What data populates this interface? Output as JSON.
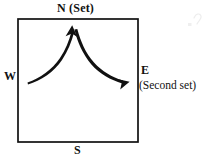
{
  "figure": {
    "type": "compass-box-diagram",
    "background_color": "#ffffff",
    "ink_color": "#111111",
    "box": {
      "name": "compass-square",
      "x": 18,
      "y": 19,
      "width": 120,
      "height": 123,
      "stroke_width": 1.6
    },
    "labels": {
      "north": "N (Set)",
      "west": "W",
      "south": "S",
      "east": "E",
      "east_secondary": "(Second set)"
    },
    "arrows": [
      {
        "name": "west-to-north-arrow",
        "from": "W",
        "to": "N",
        "start": [
          27,
          81
        ],
        "end": [
          72,
          27
        ],
        "direction": "up-right",
        "style": "curved-tapered"
      },
      {
        "name": "north-to-east-arrow",
        "from": "N",
        "to": "E",
        "start": [
          78,
          29
        ],
        "end": [
          128,
          80
        ],
        "direction": "down-right",
        "style": "curved-tapered"
      }
    ]
  }
}
